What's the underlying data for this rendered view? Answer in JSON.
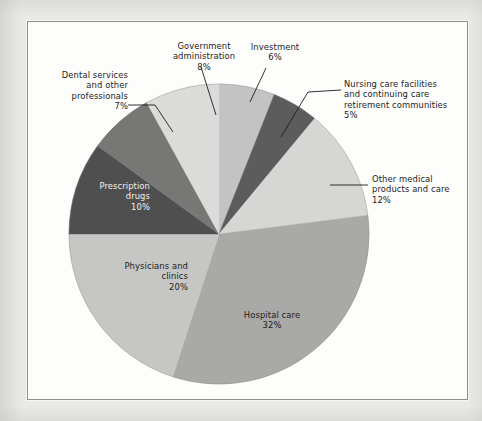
{
  "figure": {
    "background_color": "#e9e9e7",
    "panel_color": "#fdfdfc",
    "border_color": "#8e8e8c"
  },
  "chart_data": {
    "type": "pie",
    "title": "",
    "subtitle": "",
    "xlabel": "",
    "ylabel": "",
    "legend_position": "none",
    "grid": false,
    "start_angle_deg": 0,
    "direction": "clockwise",
    "units": "percent",
    "total": 100,
    "categories": [
      "Investment",
      "Nursing care facilities and continuing care retirement communities",
      "Other medical products and care",
      "Hospital care",
      "Physicians and clinics",
      "Prescription drugs",
      "Dental services and other professionals",
      "Government administration"
    ],
    "values": [
      6,
      5,
      12,
      32,
      20,
      10,
      7,
      8
    ],
    "slices": [
      {
        "id": "investment",
        "label": "Investment",
        "label_lines": [
          "Investment",
          "6%"
        ],
        "value": 6,
        "percent_text": "6%",
        "color": "#c3c3c3",
        "label_placement": "outside",
        "leader_line": true
      },
      {
        "id": "nursing-care",
        "label": "Nursing care facilities and continuing care retirement communities",
        "label_lines": [
          "Nursing care facilities",
          "and continuing care",
          "retirement communities",
          "5%"
        ],
        "value": 5,
        "percent_text": "5%",
        "color": "#5c5c5c",
        "label_placement": "outside",
        "leader_line": true
      },
      {
        "id": "other-medical-products",
        "label": "Other medical products and care",
        "label_lines": [
          "Other medical",
          "products and care",
          "12%"
        ],
        "value": 12,
        "percent_text": "12%",
        "color": "#d6d6d4",
        "label_placement": "outside",
        "leader_line": true
      },
      {
        "id": "hospital-care",
        "label": "Hospital care",
        "label_lines": [
          "Hospital care",
          "32%"
        ],
        "value": 32,
        "percent_text": "32%",
        "color": "#a9a9a7",
        "label_placement": "inside",
        "leader_line": false
      },
      {
        "id": "physicians-and-clinics",
        "label": "Physicians and clinics",
        "label_lines": [
          "Physicians and",
          "clinics",
          "20%"
        ],
        "value": 20,
        "percent_text": "20%",
        "color": "#c6c6c4",
        "label_placement": "inside",
        "leader_line": false
      },
      {
        "id": "prescription-drugs",
        "label": "Prescription drugs",
        "label_lines": [
          "Prescription",
          "drugs",
          "10%"
        ],
        "value": 10,
        "percent_text": "10%",
        "color": "#4f4f4f",
        "label_placement": "inside",
        "leader_line": false
      },
      {
        "id": "dental-services",
        "label": "Dental services and other professionals",
        "label_lines": [
          "Dental services",
          "and other",
          "professionals",
          "7%"
        ],
        "value": 7,
        "percent_text": "7%",
        "color": "#777775",
        "label_placement": "outside",
        "leader_line": true
      },
      {
        "id": "government-administration",
        "label": "Government administration",
        "label_lines": [
          "Government",
          "administration",
          "8%"
        ],
        "value": 8,
        "percent_text": "8%",
        "color": "#dbdbd9",
        "label_placement": "outside",
        "leader_line": true
      }
    ]
  },
  "labels": {
    "government_administration": "Government\nadministration\n8%",
    "investment": "Investment\n6%",
    "nursing_care": "Nursing care facilities\nand continuing care\nretirement communities\n5%",
    "other_medical": "Other medical\nproducts and care\n12%",
    "hospital_care": "Hospital care\n32%",
    "physicians_clinics": "Physicians and\nclinics\n20%",
    "prescription_drugs": "Prescription\ndrugs\n10%",
    "dental_services": "Dental services\nand other\nprofessionals\n7%"
  }
}
